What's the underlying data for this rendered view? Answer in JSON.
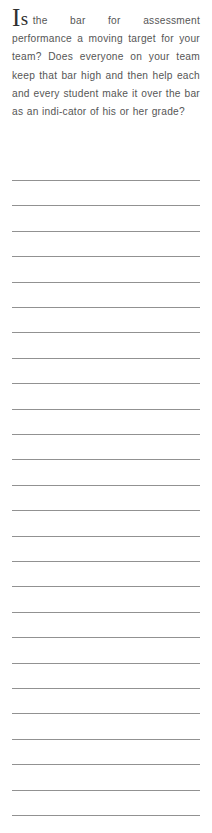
{
  "page": {
    "type": "worksheet-page",
    "background_color": "#ffffff",
    "width": 212,
    "height": 833
  },
  "prompt": {
    "dropcap_major": "I",
    "dropcap_minor": "s",
    "dropcap_word": "Is",
    "text": "the bar for assessment performance a moving target for your team? Does everyone on your team keep that bar high and then help each and every student make it over the bar as an indi-cator of his or her grade?",
    "full_question": "Is the bar for assessment performance a moving target for your team? Does everyone on your team keep that bar high and then help each and every student make it over the bar as an indicator of his or her grade?",
    "text_color": "#565656",
    "dropcap_color": "#2f2f2f",
    "alignment": "justify",
    "lines": [
      "Is the bar for assessment",
      "performance a moving target for",
      "your team? Does everyone on",
      "your team keep that bar high and",
      "then help each and every student",
      "make it over the bar as an indi-",
      "cator of his or her grade?"
    ]
  },
  "ruled_area": {
    "label": "response-writing-lines",
    "line_count": 26,
    "line_color": "#9a9a9a",
    "line_thickness_px": 1,
    "line_spacing_px": 25.4,
    "left_margin_px": 12,
    "right_margin_px": 12,
    "first_line_top_px": 180,
    "lines": [
      {
        "index": 1,
        "value": ""
      },
      {
        "index": 2,
        "value": ""
      },
      {
        "index": 3,
        "value": ""
      },
      {
        "index": 4,
        "value": ""
      },
      {
        "index": 5,
        "value": ""
      },
      {
        "index": 6,
        "value": ""
      },
      {
        "index": 7,
        "value": ""
      },
      {
        "index": 8,
        "value": ""
      },
      {
        "index": 9,
        "value": ""
      },
      {
        "index": 10,
        "value": ""
      },
      {
        "index": 11,
        "value": ""
      },
      {
        "index": 12,
        "value": ""
      },
      {
        "index": 13,
        "value": ""
      },
      {
        "index": 14,
        "value": ""
      },
      {
        "index": 15,
        "value": ""
      },
      {
        "index": 16,
        "value": ""
      },
      {
        "index": 17,
        "value": ""
      },
      {
        "index": 18,
        "value": ""
      },
      {
        "index": 19,
        "value": ""
      },
      {
        "index": 20,
        "value": ""
      },
      {
        "index": 21,
        "value": ""
      },
      {
        "index": 22,
        "value": ""
      },
      {
        "index": 23,
        "value": ""
      },
      {
        "index": 24,
        "value": ""
      },
      {
        "index": 25,
        "value": ""
      },
      {
        "index": 26,
        "value": ""
      }
    ]
  }
}
